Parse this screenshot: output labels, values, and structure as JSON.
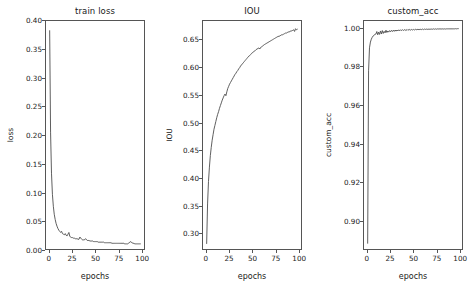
{
  "figure": {
    "background": "#ffffff",
    "line_color": "#4d4d4d",
    "n_panels": 3
  },
  "chart_data": [
    {
      "type": "line",
      "title": "train loss",
      "xlabel": "epochs",
      "ylabel": "loss",
      "xlim": [
        -4,
        103
      ],
      "ylim": [
        0.0,
        0.4
      ],
      "xticks": [
        0,
        25,
        50,
        75,
        100
      ],
      "xticklabels": [
        "0",
        "25",
        "50",
        "75",
        "100"
      ],
      "yticks": [
        0.0,
        0.05,
        0.1,
        0.15,
        0.2,
        0.25,
        0.3,
        0.35,
        0.4
      ],
      "yticklabels": [
        "0.00",
        "0.05",
        "0.10",
        "0.15",
        "0.20",
        "0.25",
        "0.30",
        "0.35",
        "0.40"
      ],
      "grid": false,
      "legend": null,
      "series": [
        {
          "name": "loss",
          "color": "#4d4d4d",
          "x": [
            0,
            1,
            2,
            3,
            4,
            5,
            6,
            7,
            8,
            9,
            10,
            11,
            12,
            13,
            14,
            15,
            16,
            17,
            18,
            19,
            20,
            21,
            22,
            23,
            24,
            25,
            26,
            27,
            28,
            29,
            30,
            31,
            32,
            33,
            34,
            35,
            36,
            37,
            38,
            39,
            40,
            41,
            42,
            43,
            44,
            45,
            46,
            47,
            48,
            49,
            50,
            51,
            52,
            53,
            54,
            55,
            56,
            57,
            58,
            59,
            60,
            61,
            62,
            63,
            64,
            65,
            66,
            67,
            68,
            69,
            70,
            71,
            72,
            73,
            74,
            75,
            76,
            77,
            78,
            79,
            80,
            81,
            82,
            83,
            84,
            85,
            86,
            87,
            88,
            89,
            90,
            91,
            92,
            93,
            94,
            95,
            96,
            97,
            98,
            99
          ],
          "y": [
            0.383,
            0.205,
            0.133,
            0.096,
            0.075,
            0.061,
            0.052,
            0.045,
            0.04,
            0.036,
            0.033,
            0.031,
            0.029,
            0.031,
            0.027,
            0.026,
            0.025,
            0.027,
            0.024,
            0.023,
            0.026,
            0.029,
            0.022,
            0.021,
            0.02,
            0.02,
            0.019,
            0.019,
            0.018,
            0.018,
            0.018,
            0.017,
            0.017,
            0.021,
            0.019,
            0.017,
            0.016,
            0.016,
            0.016,
            0.018,
            0.017,
            0.015,
            0.015,
            0.015,
            0.014,
            0.014,
            0.014,
            0.014,
            0.013,
            0.013,
            0.013,
            0.013,
            0.013,
            0.012,
            0.012,
            0.012,
            0.012,
            0.012,
            0.012,
            0.012,
            0.011,
            0.011,
            0.011,
            0.011,
            0.011,
            0.011,
            0.011,
            0.011,
            0.01,
            0.01,
            0.01,
            0.01,
            0.01,
            0.01,
            0.01,
            0.01,
            0.01,
            0.01,
            0.01,
            0.01,
            0.01,
            0.01,
            0.009,
            0.009,
            0.009,
            0.009,
            0.01,
            0.011,
            0.013,
            0.012,
            0.011,
            0.01,
            0.01,
            0.009,
            0.009,
            0.009,
            0.009,
            0.009,
            0.009,
            0.009
          ]
        }
      ]
    },
    {
      "type": "line",
      "title": "IOU",
      "xlabel": "epochs",
      "ylabel": "IOU",
      "xlim": [
        -4,
        103
      ],
      "ylim": [
        0.27,
        0.685
      ],
      "xticks": [
        0,
        25,
        50,
        75,
        100
      ],
      "xticklabels": [
        "0",
        "25",
        "50",
        "75",
        "100"
      ],
      "yticks": [
        0.3,
        0.35,
        0.4,
        0.45,
        0.5,
        0.55,
        0.6,
        0.65
      ],
      "yticklabels": [
        "0.30",
        "0.35",
        "0.40",
        "0.45",
        "0.50",
        "0.55",
        "0.60",
        "0.65"
      ],
      "grid": false,
      "legend": null,
      "series": [
        {
          "name": "IOU",
          "color": "#4d4d4d",
          "x": [
            0,
            1,
            2,
            3,
            4,
            5,
            6,
            7,
            8,
            9,
            10,
            11,
            12,
            13,
            14,
            15,
            16,
            17,
            18,
            19,
            20,
            21,
            22,
            23,
            24,
            25,
            26,
            27,
            28,
            29,
            30,
            31,
            32,
            33,
            34,
            35,
            36,
            37,
            38,
            39,
            40,
            41,
            42,
            43,
            44,
            45,
            46,
            47,
            48,
            49,
            50,
            51,
            52,
            53,
            54,
            55,
            56,
            57,
            58,
            59,
            60,
            61,
            62,
            63,
            64,
            65,
            66,
            67,
            68,
            69,
            70,
            71,
            72,
            73,
            74,
            75,
            76,
            77,
            78,
            79,
            80,
            81,
            82,
            83,
            84,
            85,
            86,
            87,
            88,
            89,
            90,
            91,
            92,
            93,
            94,
            95,
            96,
            97,
            98,
            99
          ],
          "y": [
            0.28,
            0.352,
            0.393,
            0.419,
            0.44,
            0.455,
            0.468,
            0.478,
            0.488,
            0.495,
            0.502,
            0.509,
            0.515,
            0.52,
            0.526,
            0.531,
            0.536,
            0.541,
            0.545,
            0.549,
            0.552,
            0.549,
            0.556,
            0.562,
            0.566,
            0.57,
            0.573,
            0.576,
            0.579,
            0.582,
            0.585,
            0.588,
            0.59,
            0.593,
            0.595,
            0.598,
            0.6,
            0.603,
            0.605,
            0.607,
            0.609,
            0.611,
            0.613,
            0.615,
            0.617,
            0.619,
            0.621,
            0.622,
            0.624,
            0.626,
            0.627,
            0.629,
            0.63,
            0.631,
            0.633,
            0.634,
            0.635,
            0.636,
            0.634,
            0.637,
            0.638,
            0.639,
            0.641,
            0.642,
            0.643,
            0.644,
            0.645,
            0.646,
            0.647,
            0.648,
            0.649,
            0.65,
            0.651,
            0.652,
            0.653,
            0.654,
            0.655,
            0.656,
            0.657,
            0.657,
            0.658,
            0.659,
            0.66,
            0.66,
            0.661,
            0.662,
            0.663,
            0.663,
            0.664,
            0.665,
            0.665,
            0.666,
            0.667,
            0.667,
            0.668,
            0.669,
            0.666,
            0.671,
            0.669,
            0.67
          ]
        }
      ]
    },
    {
      "type": "line",
      "title": "custom_acc",
      "xlabel": "epochs",
      "ylabel": "custom_acc",
      "xlim": [
        -4,
        103
      ],
      "ylim": [
        0.885,
        1.004
      ],
      "xticks": [
        0,
        25,
        50,
        75,
        100
      ],
      "xticklabels": [
        "0",
        "25",
        "50",
        "75",
        "100"
      ],
      "yticks": [
        0.9,
        0.92,
        0.94,
        0.96,
        0.98,
        1.0
      ],
      "yticklabels": [
        "0.90",
        "0.92",
        "0.94",
        "0.96",
        "0.98",
        "1.00"
      ],
      "grid": false,
      "legend": null,
      "series": [
        {
          "name": "custom_acc",
          "color": "#4d4d4d",
          "x": [
            0,
            1,
            2,
            3,
            4,
            5,
            6,
            7,
            8,
            9,
            10,
            11,
            12,
            13,
            14,
            15,
            16,
            17,
            18,
            19,
            20,
            21,
            22,
            23,
            24,
            25,
            26,
            27,
            28,
            29,
            30,
            31,
            32,
            33,
            34,
            35,
            36,
            37,
            38,
            39,
            40,
            41,
            42,
            43,
            44,
            45,
            46,
            47,
            48,
            49,
            50,
            51,
            52,
            53,
            54,
            55,
            56,
            57,
            58,
            59,
            60,
            61,
            62,
            63,
            64,
            65,
            66,
            67,
            68,
            69,
            70,
            71,
            72,
            73,
            74,
            75,
            76,
            77,
            78,
            79,
            80,
            81,
            82,
            83,
            84,
            85,
            86,
            87,
            88,
            89,
            90,
            91,
            92,
            93,
            94,
            95,
            96,
            97,
            98,
            99
          ],
          "y": [
            0.888,
            0.978,
            0.99,
            0.993,
            0.9945,
            0.9955,
            0.9962,
            0.9966,
            0.997,
            0.9972,
            0.9985,
            0.9968,
            0.9982,
            0.997,
            0.9988,
            0.9972,
            0.999,
            0.9975,
            0.9986,
            0.9978,
            0.9992,
            0.998,
            0.9988,
            0.9982,
            0.999,
            0.9984,
            0.9991,
            0.9985,
            0.9992,
            0.9986,
            0.9993,
            0.9987,
            0.9993,
            0.9988,
            0.9994,
            0.9989,
            0.9994,
            0.999,
            0.9995,
            0.999,
            0.9995,
            0.9991,
            0.9995,
            0.9991,
            0.9996,
            0.9992,
            0.9996,
            0.9992,
            0.9996,
            0.9993,
            0.9996,
            0.9993,
            0.9997,
            0.9994,
            0.9997,
            0.9994,
            0.9997,
            0.9995,
            0.9997,
            0.9995,
            0.9998,
            0.9995,
            0.9998,
            0.9996,
            0.9998,
            0.9996,
            0.9998,
            0.9996,
            0.9998,
            0.9997,
            0.9998,
            0.9997,
            0.9999,
            0.9997,
            0.9999,
            0.9997,
            0.9999,
            0.9998,
            0.9999,
            0.9998,
            0.9999,
            0.9998,
            0.9999,
            0.9998,
            0.9999,
            0.9998,
            0.9999,
            0.9999,
            0.9999,
            0.9999,
            0.9999,
            0.9999,
            0.9999,
            0.9999,
            0.9999,
            0.9999,
            1.0,
            0.9999,
            1.0,
            1.0
          ]
        }
      ]
    }
  ]
}
